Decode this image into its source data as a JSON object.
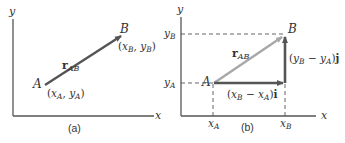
{
  "colors": {
    "axis": "#555555",
    "vector_dark": "#555555",
    "vector_light": "#a8a8a8",
    "dashed": "#555555",
    "text": "#333333"
  },
  "panel_a": {
    "caption": "(a)",
    "axis_x_label": "x",
    "axis_y_label": "y",
    "point_A_label": "A",
    "point_B_label": "B",
    "coord_A": {
      "open": "(",
      "x": "x",
      "xs": "A",
      "sep": ", ",
      "y": "y",
      "ys": "A",
      "close": ")"
    },
    "coord_B": {
      "open": "(",
      "x": "x",
      "xs": "B",
      "sep": ", ",
      "y": "y",
      "ys": "B",
      "close": ")"
    },
    "vector_label": {
      "main": "r",
      "sub": "AB"
    }
  },
  "panel_b": {
    "caption": "(b)",
    "axis_x_label": "x",
    "axis_y_label": "y",
    "point_A_label": "A",
    "point_B_label": "B",
    "tick_xA": {
      "main": "x",
      "sub": "A"
    },
    "tick_xB": {
      "main": "x",
      "sub": "B"
    },
    "tick_yA": {
      "main": "y",
      "sub": "A"
    },
    "tick_yB": {
      "main": "y",
      "sub": "B"
    },
    "vector_label": {
      "main": "r",
      "sub": "AB"
    },
    "x_component": {
      "open": "(",
      "a": "x",
      "as": "B",
      "minus": " − ",
      "b": "x",
      "bs": "A",
      "close": ")",
      "unit": "i"
    },
    "y_component": {
      "open": "(",
      "a": "y",
      "as": "B",
      "minus": " − ",
      "b": "y",
      "bs": "A",
      "close": ")",
      "unit": "j"
    }
  }
}
